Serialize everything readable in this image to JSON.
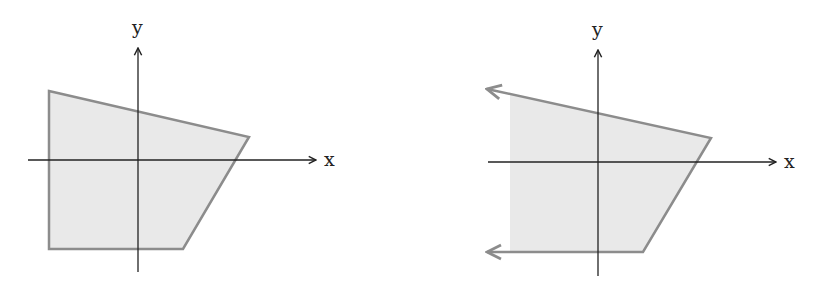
{
  "diagram": {
    "type": "coordinate-region-diagram",
    "colors": {
      "fill": "#e9e9e9",
      "edge": "#8c8c8c",
      "axis": "#222222",
      "background": "#ffffff"
    },
    "panels": [
      {
        "id": "left",
        "description": "Bounded convex quadrilateral region (closed polygon)",
        "axis_labels": {
          "x": "x",
          "y": "y"
        },
        "axes": {
          "origin": [
            138,
            160
          ],
          "x_axis": {
            "from": [
              28,
              160
            ],
            "to": [
              316,
              160
            ],
            "arrow": true
          },
          "y_axis": {
            "from": [
              138,
              272
            ],
            "to": [
              138,
              48
            ],
            "arrow": true
          }
        },
        "polygon": {
          "closed": true,
          "vertices": [
            [
              49,
              91
            ],
            [
              249,
              137
            ],
            [
              183,
              249
            ],
            [
              49,
              249
            ]
          ]
        }
      },
      {
        "id": "right",
        "description": "Unbounded region extending to the left (edges end in arrows)",
        "axis_labels": {
          "x": "x",
          "y": "y"
        },
        "axes": {
          "origin": [
            598,
            162
          ],
          "x_axis": {
            "from": [
              488,
              162
            ],
            "to": [
              776,
              162
            ],
            "arrow": true
          },
          "y_axis": {
            "from": [
              598,
              276
            ],
            "to": [
              598,
              50
            ],
            "arrow": true
          }
        },
        "polygon": {
          "closed": false,
          "vertices": [
            [
              487,
              89
            ],
            [
              711,
              138
            ],
            [
              643,
              252
            ],
            [
              487,
              252
            ]
          ],
          "fill_left_edge": 510,
          "open_edges_arrowheads": [
            "top-left",
            "bottom-left"
          ]
        }
      }
    ]
  }
}
